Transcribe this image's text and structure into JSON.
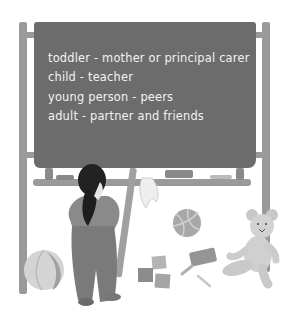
{
  "illustration": {
    "description": "Child standing in front of a chalkboard on an easel, surrounded by toys",
    "chalkboard": {
      "lines": [
        "toddler - mother or principal carer",
        "child - teacher",
        "young person - peers",
        "adult - partner and friends"
      ]
    },
    "objects": [
      "easel",
      "chalkboard",
      "child",
      "cloth",
      "volleyball",
      "beach-ball",
      "blocks",
      "board-eraser",
      "chalk",
      "teddy-bear"
    ],
    "colors": {
      "board": "#6c6c6c",
      "easel": "#9a9a9a",
      "chalk_text": "#f2f2f2",
      "background": "#ffffff"
    }
  }
}
